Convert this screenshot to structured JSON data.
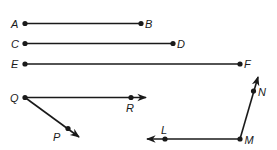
{
  "diagram": {
    "segments": [
      {
        "name": "AB",
        "from": "A",
        "to": "B"
      },
      {
        "name": "CD",
        "from": "C",
        "to": "D"
      },
      {
        "name": "EF",
        "from": "E",
        "to": "F"
      }
    ],
    "rays": [
      {
        "name": "QR",
        "vertex": "Q",
        "through": "R"
      },
      {
        "name": "QP",
        "vertex": "Q",
        "through": "P"
      },
      {
        "name": "MN",
        "vertex": "M",
        "through": "N"
      },
      {
        "name": "ML",
        "vertex": "M",
        "through": "L"
      }
    ],
    "angles": [
      {
        "name": "PQR",
        "vertex": "Q"
      },
      {
        "name": "LMN",
        "vertex": "M"
      }
    ],
    "labels": {
      "A": "A",
      "B": "B",
      "C": "C",
      "D": "D",
      "E": "E",
      "F": "F",
      "Q": "Q",
      "R": "R",
      "P": "P",
      "N": "N",
      "M": "M",
      "L": "L"
    },
    "colors": {
      "ink": "#1a1a1a",
      "background": "#ffffff"
    }
  }
}
